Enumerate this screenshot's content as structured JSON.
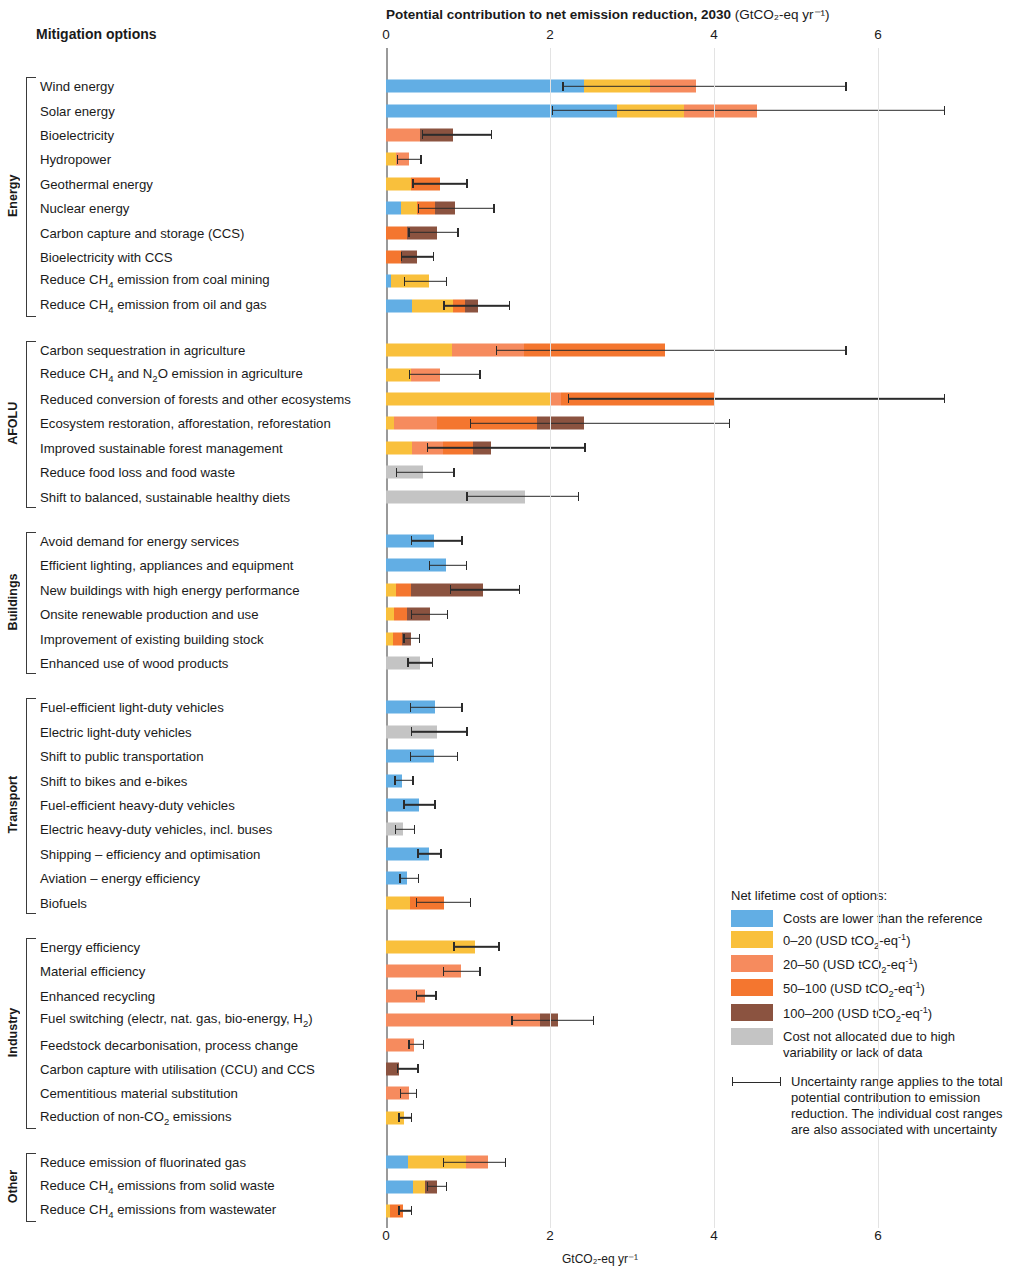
{
  "header": {
    "mitigation_options_label": "Mitigation options",
    "title_main": "Potential contribution to net emission reduction, 2030",
    "title_unit": "(GtCO₂-eq yr⁻¹)",
    "bottom_axis_unit": "GtCO₂-eq yr⁻¹"
  },
  "legend": {
    "title": "Net lifetime cost of options:",
    "items": [
      {
        "label": "Costs are lower than the reference",
        "color": "#62aee4",
        "key": "lower"
      },
      {
        "label": "0–20 (USD tCO₂-eq⁻¹)",
        "color": "#f9c03c",
        "key": "c0_20"
      },
      {
        "label": "20–50 (USD tCO₂-eq⁻¹)",
        "color": "#f68b5e",
        "key": "c20_50"
      },
      {
        "label": "50–100 (USD tCO₂-eq⁻¹)",
        "color": "#f4762f",
        "key": "c50_100"
      },
      {
        "label": "100–200 (USD tCO₂-eq⁻¹)",
        "color": "#8b5340",
        "key": "c100_200"
      },
      {
        "label": "Cost not allocated due to high variability or lack of data",
        "color": "#c4c4c4",
        "key": "na"
      }
    ],
    "note": "Uncertainty range applies to the total potential contribution to emission reduction. The individual cost ranges are also associated with uncertainty"
  },
  "chart_data": {
    "type": "bar",
    "orientation": "horizontal",
    "stacked": true,
    "xlabel": "GtCO2-eq yr-1",
    "ylabel": "Mitigation options",
    "xlim": [
      0,
      6.8
    ],
    "xticks": [
      0,
      2,
      4,
      6
    ],
    "grid": "vertical",
    "legend_position": "bottom-right",
    "cost_classes": [
      "lower",
      "c0_20",
      "c20_50",
      "c50_100",
      "c100_200",
      "na"
    ],
    "groups": [
      {
        "name": "Energy",
        "rows": [
          {
            "label": "Wind energy",
            "segments": [
              {
                "class": "lower",
                "value": 2.42
              },
              {
                "class": "c0_20",
                "value": 0.8
              },
              {
                "class": "c20_50",
                "value": 0.56
              }
            ],
            "total": 3.78,
            "unc_low": 2.15,
            "unc_high": 5.6
          },
          {
            "label": "Solar energy",
            "segments": [
              {
                "class": "lower",
                "value": 2.82
              },
              {
                "class": "c0_20",
                "value": 0.82
              },
              {
                "class": "c20_50",
                "value": 0.88
              }
            ],
            "total": 4.52,
            "unc_low": 2.02,
            "unc_high": 6.8
          },
          {
            "label": "Bioelectricity",
            "segments": [
              {
                "class": "c20_50",
                "value": 0.42
              },
              {
                "class": "c100_200",
                "value": 0.4
              }
            ],
            "total": 0.82,
            "unc_low": 0.44,
            "unc_high": 1.28
          },
          {
            "label": "Hydropower",
            "segments": [
              {
                "class": "c0_20",
                "value": 0.12
              },
              {
                "class": "c20_50",
                "value": 0.16
              }
            ],
            "total": 0.28,
            "unc_low": 0.13,
            "unc_high": 0.42
          },
          {
            "label": "Geothermal energy",
            "segments": [
              {
                "class": "c0_20",
                "value": 0.3
              },
              {
                "class": "c50_100",
                "value": 0.36
              }
            ],
            "total": 0.66,
            "unc_low": 0.32,
            "unc_high": 0.98
          },
          {
            "label": "Nuclear energy",
            "segments": [
              {
                "class": "lower",
                "value": 0.18
              },
              {
                "class": "c0_20",
                "value": 0.2
              },
              {
                "class": "c50_100",
                "value": 0.22
              },
              {
                "class": "c100_200",
                "value": 0.24
              }
            ],
            "total": 0.84,
            "unc_low": 0.39,
            "unc_high": 1.31
          },
          {
            "label": "Carbon capture and storage (CCS)",
            "segments": [
              {
                "class": "c50_100",
                "value": 0.26
              },
              {
                "class": "c100_200",
                "value": 0.36
              }
            ],
            "total": 0.62,
            "unc_low": 0.27,
            "unc_high": 0.87
          },
          {
            "label": "Bioelectricity with CCS",
            "segments": [
              {
                "class": "c50_100",
                "value": 0.18
              },
              {
                "class": "c100_200",
                "value": 0.2
              }
            ],
            "total": 0.38,
            "unc_low": 0.18,
            "unc_high": 0.57
          },
          {
            "label": "Reduce CH₄ emission from coal mining",
            "segments": [
              {
                "class": "lower",
                "value": 0.06
              },
              {
                "class": "c0_20",
                "value": 0.46
              }
            ],
            "total": 0.52,
            "unc_low": 0.22,
            "unc_high": 0.73
          },
          {
            "label": "Reduce CH₄ emission from oil and gas",
            "segments": [
              {
                "class": "lower",
                "value": 0.32
              },
              {
                "class": "c0_20",
                "value": 0.5
              },
              {
                "class": "c50_100",
                "value": 0.14
              },
              {
                "class": "c100_200",
                "value": 0.16
              }
            ],
            "total": 1.12,
            "unc_low": 0.7,
            "unc_high": 1.5
          }
        ]
      },
      {
        "name": "AFOLU",
        "rows": [
          {
            "label": "Carbon sequestration in agriculture",
            "segments": [
              {
                "class": "c0_20",
                "value": 0.8
              },
              {
                "class": "c20_50",
                "value": 0.88
              },
              {
                "class": "c50_100",
                "value": 1.72
              }
            ],
            "total": 3.4,
            "unc_low": 1.34,
            "unc_high": 5.6
          },
          {
            "label": "Reduce CH₄ and N₂O emission in agriculture",
            "segments": [
              {
                "class": "c0_20",
                "value": 0.3
              },
              {
                "class": "c20_50",
                "value": 0.36
              }
            ],
            "total": 0.66,
            "unc_low": 0.28,
            "unc_high": 1.14
          },
          {
            "label": "Reduced conversion of forests and other ecosystems",
            "segments": [
              {
                "class": "c0_20",
                "value": 2.0
              },
              {
                "class": "c20_50",
                "value": 0.14
              },
              {
                "class": "c50_100",
                "value": 1.86
              }
            ],
            "total": 4.0,
            "unc_low": 2.22,
            "unc_high": 6.8
          },
          {
            "label": "Ecosystem restoration, afforestation, reforestation",
            "segments": [
              {
                "class": "c0_20",
                "value": 0.1
              },
              {
                "class": "c20_50",
                "value": 0.52
              },
              {
                "class": "c50_100",
                "value": 1.22
              },
              {
                "class": "c100_200",
                "value": 0.58
              }
            ],
            "total": 2.42,
            "unc_low": 1.02,
            "unc_high": 4.18
          },
          {
            "label": "Improved sustainable forest management",
            "segments": [
              {
                "class": "c0_20",
                "value": 0.32
              },
              {
                "class": "c20_50",
                "value": 0.38
              },
              {
                "class": "c50_100",
                "value": 0.36
              },
              {
                "class": "c100_200",
                "value": 0.22
              }
            ],
            "total": 1.28,
            "unc_low": 0.5,
            "unc_high": 2.42
          },
          {
            "label": "Reduce food loss and food waste",
            "segments": [
              {
                "class": "na",
                "value": 0.45
              }
            ],
            "total": 0.45,
            "unc_low": 0.12,
            "unc_high": 0.82
          },
          {
            "label": "Shift to balanced, sustainable healthy diets",
            "segments": [
              {
                "class": "na",
                "value": 1.7
              }
            ],
            "total": 1.7,
            "unc_low": 0.98,
            "unc_high": 2.34
          }
        ]
      },
      {
        "name": "Buildings",
        "rows": [
          {
            "label": "Avoid demand for energy services",
            "segments": [
              {
                "class": "lower",
                "value": 0.59
              }
            ],
            "total": 0.59,
            "unc_low": 0.3,
            "unc_high": 0.92
          },
          {
            "label": "Efficient lighting, appliances and equipment",
            "segments": [
              {
                "class": "lower",
                "value": 0.73
              }
            ],
            "total": 0.73,
            "unc_low": 0.52,
            "unc_high": 0.97
          },
          {
            "label": "New buildings with high energy performance",
            "segments": [
              {
                "class": "c0_20",
                "value": 0.12
              },
              {
                "class": "c50_100",
                "value": 0.18
              },
              {
                "class": "c100_200",
                "value": 0.88
              }
            ],
            "total": 1.18,
            "unc_low": 0.78,
            "unc_high": 1.62
          },
          {
            "label": "Onsite renewable production and use",
            "segments": [
              {
                "class": "c0_20",
                "value": 0.1
              },
              {
                "class": "c50_100",
                "value": 0.16
              },
              {
                "class": "c100_200",
                "value": 0.28
              }
            ],
            "total": 0.54,
            "unc_low": 0.3,
            "unc_high": 0.74
          },
          {
            "label": "Improvement of existing building stock",
            "segments": [
              {
                "class": "c0_20",
                "value": 0.08
              },
              {
                "class": "c50_100",
                "value": 0.12
              },
              {
                "class": "c100_200",
                "value": 0.1
              }
            ],
            "total": 0.3,
            "unc_low": 0.21,
            "unc_high": 0.4
          },
          {
            "label": "Enhanced use of wood products",
            "segments": [
              {
                "class": "na",
                "value": 0.41
              }
            ],
            "total": 0.41,
            "unc_low": 0.26,
            "unc_high": 0.56
          }
        ]
      },
      {
        "name": "Transport",
        "rows": [
          {
            "label": "Fuel-efficient light-duty vehicles",
            "segments": [
              {
                "class": "lower",
                "value": 0.6
              }
            ],
            "total": 0.6,
            "unc_low": 0.29,
            "unc_high": 0.92
          },
          {
            "label": "Electric light-duty vehicles",
            "segments": [
              {
                "class": "na",
                "value": 0.62
              }
            ],
            "total": 0.62,
            "unc_low": 0.3,
            "unc_high": 0.98
          },
          {
            "label": "Shift to public transportation",
            "segments": [
              {
                "class": "lower",
                "value": 0.58
              }
            ],
            "total": 0.58,
            "unc_low": 0.29,
            "unc_high": 0.86
          },
          {
            "label": "Shift to bikes and e-bikes",
            "segments": [
              {
                "class": "lower",
                "value": 0.19
              }
            ],
            "total": 0.19,
            "unc_low": 0.1,
            "unc_high": 0.32
          },
          {
            "label": "Fuel-efficient heavy-duty vehicles",
            "segments": [
              {
                "class": "lower",
                "value": 0.4
              }
            ],
            "total": 0.4,
            "unc_low": 0.21,
            "unc_high": 0.59
          },
          {
            "label": "Electric heavy-duty vehicles, incl. buses",
            "segments": [
              {
                "class": "na",
                "value": 0.21
              }
            ],
            "total": 0.21,
            "unc_low": 0.11,
            "unc_high": 0.34
          },
          {
            "label": "Shipping – efficiency and optimisation",
            "segments": [
              {
                "class": "lower",
                "value": 0.52
              }
            ],
            "total": 0.52,
            "unc_low": 0.38,
            "unc_high": 0.66
          },
          {
            "label": "Aviation – energy efficiency",
            "segments": [
              {
                "class": "lower",
                "value": 0.26
              }
            ],
            "total": 0.26,
            "unc_low": 0.16,
            "unc_high": 0.39
          },
          {
            "label": "Biofuels",
            "segments": [
              {
                "class": "c0_20",
                "value": 0.29
              },
              {
                "class": "c50_100",
                "value": 0.42
              }
            ],
            "total": 0.71,
            "unc_low": 0.36,
            "unc_high": 1.02
          }
        ]
      },
      {
        "name": "Industry",
        "rows": [
          {
            "label": "Energy efficiency",
            "segments": [
              {
                "class": "c0_20",
                "value": 1.09
              }
            ],
            "total": 1.09,
            "unc_low": 0.82,
            "unc_high": 1.37
          },
          {
            "label": "Material efficiency",
            "segments": [
              {
                "class": "c20_50",
                "value": 0.92
              }
            ],
            "total": 0.92,
            "unc_low": 0.69,
            "unc_high": 1.14
          },
          {
            "label": "Enhanced recycling",
            "segments": [
              {
                "class": "c20_50",
                "value": 0.48
              }
            ],
            "total": 0.48,
            "unc_low": 0.36,
            "unc_high": 0.6
          },
          {
            "label": "Fuel switching (electr, nat. gas, bio-energy, H₂)",
            "segments": [
              {
                "class": "c20_50",
                "value": 1.88
              },
              {
                "class": "c100_200",
                "value": 0.22
              }
            ],
            "total": 2.1,
            "unc_low": 1.53,
            "unc_high": 2.52
          },
          {
            "label": "Feedstock decarbonisation, process change",
            "segments": [
              {
                "class": "c20_50",
                "value": 0.34
              }
            ],
            "total": 0.34,
            "unc_low": 0.27,
            "unc_high": 0.45
          },
          {
            "label": "Carbon capture with utilisation (CCU) and CCS",
            "segments": [
              {
                "class": "c100_200",
                "value": 0.16
              }
            ],
            "total": 0.16,
            "unc_low": 0.13,
            "unc_high": 0.38
          },
          {
            "label": "Cementitious material substitution",
            "segments": [
              {
                "class": "c20_50",
                "value": 0.28
              }
            ],
            "total": 0.28,
            "unc_low": 0.17,
            "unc_high": 0.36
          },
          {
            "label": "Reduction of non-CO₂ emissions",
            "segments": [
              {
                "class": "c0_20",
                "value": 0.22
              }
            ],
            "total": 0.22,
            "unc_low": 0.15,
            "unc_high": 0.3
          }
        ]
      },
      {
        "name": "Other",
        "rows": [
          {
            "label": "Reduce emission of fluorinated gas",
            "segments": [
              {
                "class": "lower",
                "value": 0.27
              },
              {
                "class": "c0_20",
                "value": 0.7
              },
              {
                "class": "c20_50",
                "value": 0.28
              }
            ],
            "total": 1.25,
            "unc_low": 0.69,
            "unc_high": 1.45
          },
          {
            "label": "Reduce CH₄ emissions from solid waste",
            "segments": [
              {
                "class": "lower",
                "value": 0.33
              },
              {
                "class": "c0_20",
                "value": 0.14
              },
              {
                "class": "c100_200",
                "value": 0.15
              }
            ],
            "total": 0.62,
            "unc_low": 0.5,
            "unc_high": 0.73
          },
          {
            "label": "Reduce CH₄ emissions from wastewater",
            "segments": [
              {
                "class": "c0_20",
                "value": 0.05
              },
              {
                "class": "c50_100",
                "value": 0.16
              }
            ],
            "total": 0.21,
            "unc_low": 0.15,
            "unc_high": 0.3
          }
        ]
      }
    ]
  }
}
